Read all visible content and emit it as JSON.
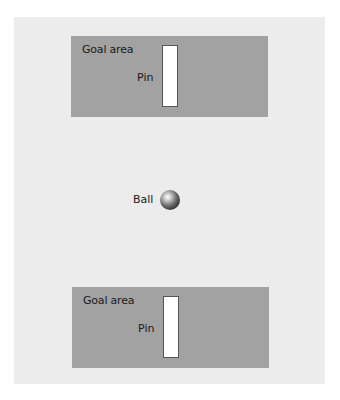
{
  "diagram": {
    "goal_areas": [
      {
        "label": "Goal area",
        "pin_label": "Pin"
      },
      {
        "label": "Goal area",
        "pin_label": "Pin"
      }
    ],
    "ball": {
      "label": "Ball"
    },
    "colors": {
      "background": "#ffffff",
      "panel": "#ececec",
      "goal_area": "#a2a2a2",
      "pin": "#ffffff"
    }
  }
}
